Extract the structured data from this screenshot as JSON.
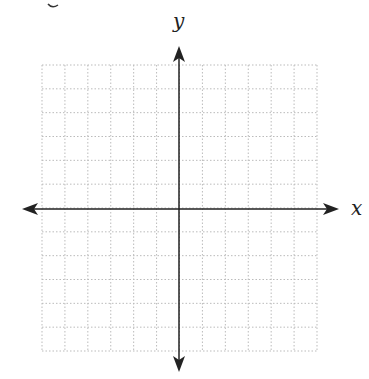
{
  "diagram": {
    "type": "coordinate-plane",
    "x_axis_label": "x",
    "y_axis_label": "y",
    "top_fragment": "y",
    "grid": {
      "columns": 12,
      "rows": 12,
      "line_style": "dotted",
      "line_color": "#bbbbbb"
    },
    "axis_color": "#222222"
  }
}
